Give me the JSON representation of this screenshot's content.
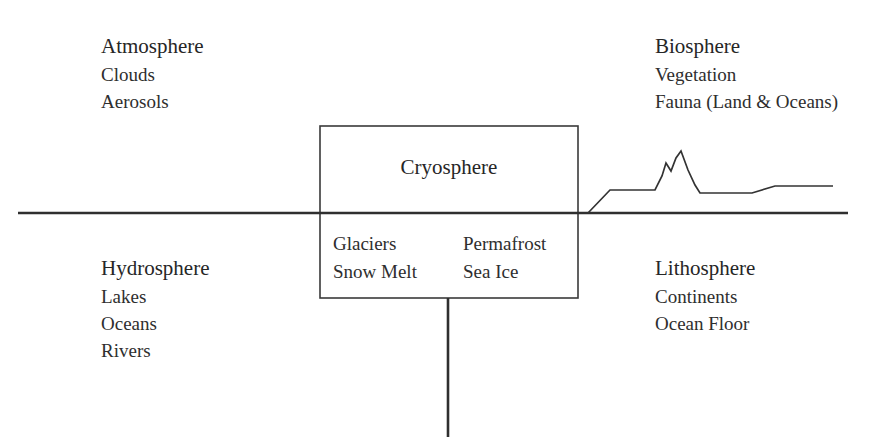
{
  "diagram": {
    "line_color": "#3a3a3a",
    "text_color": "#2b2b2b",
    "background": "#ffffff"
  },
  "quadrants": {
    "atmosphere": {
      "title": "Atmosphere",
      "items": [
        "Clouds",
        "Aerosols"
      ]
    },
    "biosphere": {
      "title": "Biosphere",
      "items": [
        "Vegetation",
        "Fauna (Land & Oceans)"
      ]
    },
    "hydrosphere": {
      "title": "Hydrosphere",
      "items": [
        "Lakes",
        "Oceans",
        "Rivers"
      ]
    },
    "lithosphere": {
      "title": "Lithosphere",
      "items": [
        "Continents",
        "Ocean Floor"
      ]
    }
  },
  "cryosphere": {
    "title": "Cryosphere",
    "left_column": [
      "Glaciers",
      "Snow Melt"
    ],
    "right_column": [
      "Permafrost",
      "Sea Ice"
    ]
  }
}
